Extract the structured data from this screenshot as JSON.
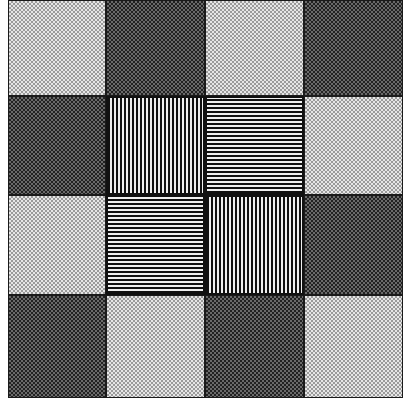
{
  "figure": {
    "rows": 4,
    "cols": 4,
    "colors": {
      "light_base": "#e6e6e6",
      "light_dot": "#9a9a9a",
      "dark_base": "#6a6a6a",
      "dark_dot": "#222222",
      "stripe_dark": "#111111",
      "stripe_light": "#f0f0f0"
    },
    "cells": [
      [
        "light",
        "dark",
        "light",
        "dark"
      ],
      [
        "dark",
        "vertical",
        "horizontal",
        "light"
      ],
      [
        "light",
        "horizontal",
        "vertical",
        "dark"
      ],
      [
        "dark",
        "light",
        "dark",
        "light"
      ]
    ]
  }
}
